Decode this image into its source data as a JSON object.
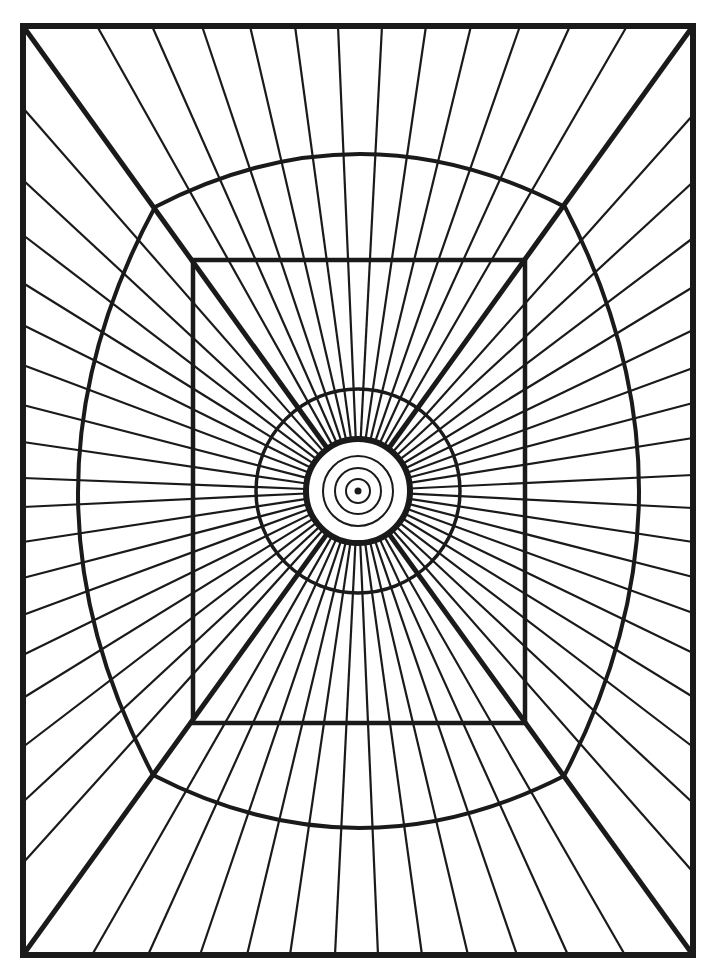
{
  "artwork": {
    "title": "Radial line optical illusion",
    "stroke_color": "#1a1a1a",
    "background_color": "#ffffff",
    "center": [
      358,
      491
    ],
    "outer_frame": {
      "x1": 23,
      "y1": 26,
      "x2": 693,
      "y2": 955
    },
    "inner_rect": {
      "x1": 193,
      "y1": 260,
      "x2": 525,
      "y2": 723
    },
    "bulged_square": {
      "corners": {
        "tl": [
          155,
          207
        ],
        "tr": [
          565,
          207
        ],
        "br": [
          564,
          776
        ],
        "bl": [
          153,
          775
        ]
      },
      "extremes": {
        "top": 154,
        "right": 639,
        "bottom": 828,
        "left": 78
      }
    },
    "rings": {
      "thin": [
        12,
        23,
        35
      ],
      "thick": 52,
      "mid": 102,
      "center_dot": 3.5
    },
    "ray_inner_radius": 52,
    "ray_endpoints": {
      "top_x": [
        97,
        152,
        202,
        250,
        295,
        338,
        382,
        426,
        471,
        520,
        570,
        627
      ],
      "bottom_x": [
        92,
        148,
        200,
        247,
        290,
        335,
        378,
        422,
        468,
        517,
        568,
        625
      ],
      "left_y": [
        108,
        180,
        235,
        283,
        325,
        365,
        405,
        442,
        478,
        507,
        542,
        578,
        615,
        655,
        698,
        747,
        802,
        863
      ],
      "right_y": [
        115,
        182,
        238,
        287,
        330,
        368,
        403,
        438,
        475,
        508,
        542,
        577,
        613,
        653,
        697,
        747,
        803,
        872
      ]
    }
  }
}
